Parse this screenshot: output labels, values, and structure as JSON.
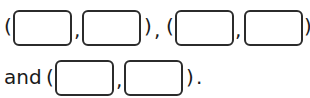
{
  "line1": {
    "open1": "(",
    "sep1": ",",
    "close1": ")",
    "between": ",",
    "open2": "(",
    "sep2": ",",
    "close2": ")"
  },
  "line2": {
    "word": "and",
    "open": "(",
    "sep": ",",
    "close": ")",
    "end": "."
  },
  "answer_boxes": [
    {
      "value": ""
    },
    {
      "value": ""
    },
    {
      "value": ""
    },
    {
      "value": ""
    },
    {
      "value": ""
    },
    {
      "value": ""
    }
  ]
}
